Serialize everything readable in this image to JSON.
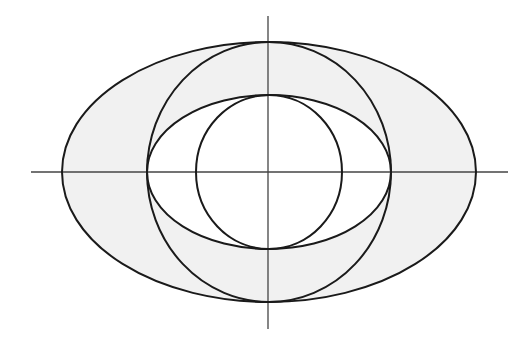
{
  "diagram": {
    "type": "nested conic sections on coordinate axes",
    "colors": {
      "background": "#ffffff",
      "shade": "#f1f1f1",
      "stroke": "#1a1a1a",
      "axis": "#444444"
    },
    "center": [
      269,
      172
    ],
    "axes": {
      "horizontal": {
        "x1": 31,
        "x2": 508,
        "y": 172
      },
      "vertical": {
        "x": 268,
        "y1": 16,
        "y2": 329
      }
    },
    "shapes": [
      {
        "name": "outer-ellipse",
        "rx": 207,
        "ry": 130,
        "shaded": true
      },
      {
        "name": "large-circle",
        "rx": 122,
        "ry": 130,
        "shaded": false
      },
      {
        "name": "inner-ellipse",
        "rx": 122,
        "ry": 77,
        "shaded": false
      },
      {
        "name": "small-circle",
        "rx": 73,
        "ry": 77,
        "shaded": false
      }
    ],
    "shaded_region": "outer ellipse minus inner ellipse"
  }
}
